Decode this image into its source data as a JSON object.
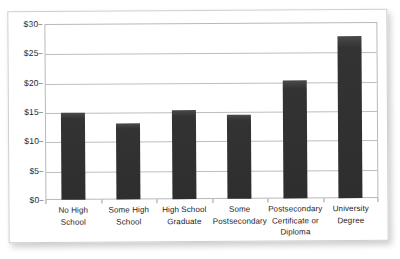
{
  "chart_data": {
    "type": "bar",
    "title": "",
    "subtitle": "",
    "xlabel": "",
    "ylabel": "",
    "categories": [
      "No High School",
      "Some High School",
      "High School Graduate",
      "Some Postsecondary",
      "Postsecondary Certificate or Diploma",
      "University Degree"
    ],
    "category_lines": [
      [
        "No High School"
      ],
      [
        "Some High",
        "School"
      ],
      [
        "High School",
        "Graduate"
      ],
      [
        "Some",
        "Postsecondary"
      ],
      [
        "Postsecondary",
        "Certificate or",
        "Diploma"
      ],
      [
        "University",
        "Degree"
      ]
    ],
    "values": [
      14.9,
      13.0,
      15.1,
      14.4,
      20.2,
      27.6
    ],
    "ylim": [
      0,
      30
    ],
    "ytick_values": [
      0,
      5,
      10,
      15,
      20,
      25,
      30
    ],
    "ytick_labels": [
      "$0",
      "$5",
      "$10",
      "$15",
      "$20",
      "$25",
      "$30"
    ],
    "grid": true,
    "legend": false,
    "legend_position": "none",
    "bar_color": "#323232",
    "gridline_color": "#bdbdbd",
    "axis_color": "#b9b9b9",
    "background_color": "#ffffff",
    "text_color": "#1c1c1c"
  }
}
